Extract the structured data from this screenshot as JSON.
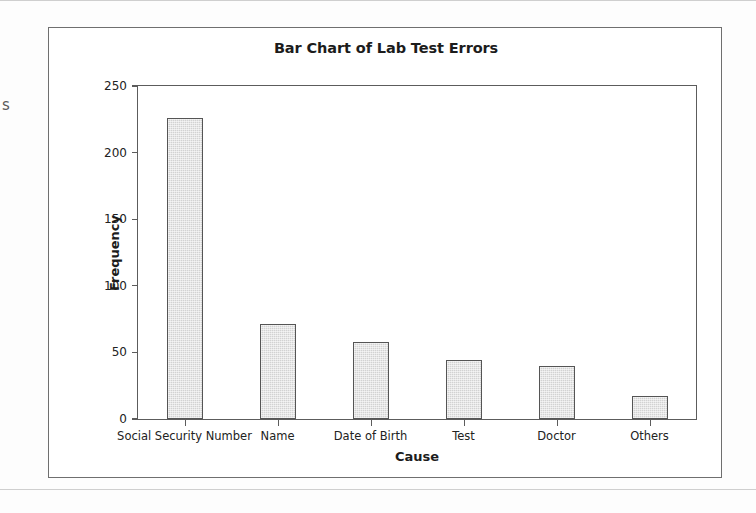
{
  "chart_data": {
    "type": "bar",
    "title": "Bar Chart of Lab Test Errors",
    "xlabel": "Cause",
    "ylabel": "Frequency",
    "categories": [
      "Social Security Number",
      "Name",
      "Date of Birth",
      "Test",
      "Doctor",
      "Others"
    ],
    "values": [
      226,
      71,
      58,
      44,
      40,
      17
    ],
    "ylim": [
      0,
      250
    ],
    "yticks": [
      0,
      50,
      100,
      150,
      200,
      250
    ],
    "ytick_labels": [
      "0",
      "50",
      "100",
      "150",
      "200",
      "250"
    ],
    "grid": false,
    "legend": false,
    "bar_fill_color": "#d2d2d2",
    "bar_edge_color": "#555555",
    "axis_color": "#5c5c5c",
    "frame_color": "#6f6f6f",
    "background_color": "#ffffff"
  },
  "page": {
    "margin_text_fragment": "s"
  }
}
